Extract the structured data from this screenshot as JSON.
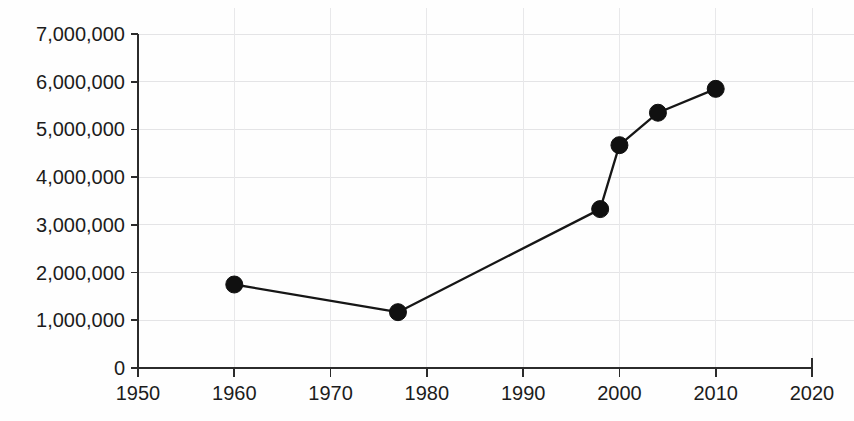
{
  "chart_data": {
    "type": "line",
    "title": "",
    "subtitle": "",
    "xlabel": "",
    "ylabel": "",
    "xlim": [
      1950,
      2020
    ],
    "ylim": [
      0,
      7000000
    ],
    "grid": true,
    "legend": "none",
    "x": [
      1960,
      1977,
      1998,
      2000,
      2004,
      2010
    ],
    "values": [
      1750000,
      1170000,
      3330000,
      4670000,
      5350000,
      5850000
    ],
    "series": [
      {
        "name": "series-1",
        "x": [
          1960,
          1977,
          1998,
          2000,
          2004,
          2010
        ],
        "values": [
          1750000,
          1170000,
          3330000,
          4670000,
          5350000,
          5850000
        ],
        "color": "#101010",
        "marker": "filled-circle"
      }
    ],
    "xticks": [
      1950,
      1960,
      1970,
      1980,
      1990,
      2000,
      2010,
      2020
    ],
    "xtick_labels": [
      "1950",
      "1960",
      "1970",
      "1980",
      "1990",
      "2000",
      "2010",
      "2020"
    ],
    "yticks": [
      0,
      1000000,
      2000000,
      3000000,
      4000000,
      5000000,
      6000000,
      7000000
    ],
    "ytick_labels": [
      "0",
      "1,000,000",
      "2,000,000",
      "3,000,000",
      "4,000,000",
      "5,000,000",
      "6,000,000",
      "7,000,000"
    ],
    "colors": {
      "line": "#101010",
      "marker": "#101010",
      "axis": "#2b2b2b",
      "grid": "#e4e4e6",
      "background": "#fefefe",
      "text": "#1c1c1c"
    }
  },
  "plot_geometry": {
    "left": 138,
    "right": 812,
    "top": 34,
    "bottom": 368
  }
}
